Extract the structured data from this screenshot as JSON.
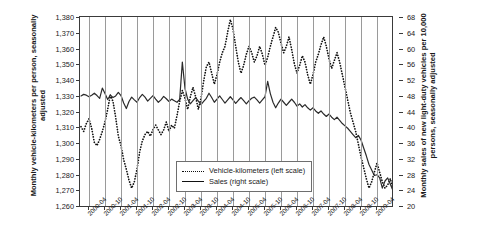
{
  "chart_data": {
    "type": "line",
    "title": "",
    "xlabel": "",
    "ylabel": "Monthly vehicle-kilometers per person, seasonally adjusted",
    "y2label": "Monthly sales of new light-duty vehicles per 10,000 persons, seasonally adjusted",
    "ylim": [
      1260,
      1380
    ],
    "y2lim": [
      20,
      68
    ],
    "ytick_labels": [
      "1,380",
      "1,370",
      "1,360",
      "1,350",
      "1,340",
      "1,330",
      "1,320",
      "1,310",
      "1,300",
      "1,290",
      "1,280",
      "1,270",
      "1,260"
    ],
    "ytick_values": [
      1380,
      1370,
      1360,
      1350,
      1340,
      1330,
      1320,
      1310,
      1300,
      1290,
      1280,
      1270,
      1260
    ],
    "y2tick_labels": [
      "68",
      "64",
      "60",
      "56",
      "52",
      "48",
      "44",
      "40",
      "36",
      "32",
      "28",
      "24",
      "20"
    ],
    "y2tick_values": [
      68,
      64,
      60,
      56,
      52,
      48,
      44,
      40,
      36,
      32,
      28,
      24,
      20
    ],
    "grid": "vertical",
    "legend_position": "inside-bottom-center",
    "x_start": "2000-01",
    "x_end": "2009-06",
    "xtick_labels": [
      "2000-04",
      "2000-10",
      "2001-04",
      "2001-10",
      "2002-04",
      "2002-10",
      "2003-04",
      "2003-10",
      "2004-04",
      "2004-10",
      "2005-04",
      "2005-10",
      "2006-04",
      "2006-10",
      "2007-04",
      "2007-10",
      "2008-04",
      "2008-10",
      "2009-04"
    ],
    "xtick_index": [
      3,
      9,
      15,
      21,
      27,
      33,
      39,
      45,
      51,
      57,
      63,
      69,
      75,
      81,
      87,
      93,
      99,
      105,
      111
    ],
    "series": [
      {
        "name": "Vehicle-kilometers (left scale)",
        "axis": "left",
        "style": "dotted",
        "color": "#111111",
        "values": [
          1311,
          1308,
          1313,
          1316,
          1310,
          1301,
          1299,
          1303,
          1308,
          1314,
          1322,
          1331,
          1327,
          1317,
          1305,
          1299,
          1290,
          1284,
          1277,
          1272,
          1276,
          1284,
          1295,
          1302,
          1306,
          1308,
          1305,
          1309,
          1312,
          1309,
          1306,
          1309,
          1314,
          1308,
          1312,
          1310,
          1318,
          1327,
          1334,
          1329,
          1322,
          1330,
          1336,
          1330,
          1322,
          1329,
          1340,
          1349,
          1352,
          1345,
          1338,
          1344,
          1352,
          1358,
          1362,
          1371,
          1379,
          1373,
          1362,
          1352,
          1345,
          1350,
          1357,
          1362,
          1358,
          1352,
          1356,
          1362,
          1357,
          1350,
          1355,
          1362,
          1368,
          1374,
          1371,
          1364,
          1358,
          1362,
          1368,
          1360,
          1351,
          1345,
          1350,
          1356,
          1352,
          1344,
          1338,
          1344,
          1352,
          1357,
          1363,
          1368,
          1362,
          1354,
          1348,
          1353,
          1358,
          1352,
          1344,
          1336,
          1328,
          1320,
          1314,
          1308,
          1300,
          1292,
          1285,
          1278,
          1272,
          1276,
          1282,
          1288,
          1282,
          1276,
          1272,
          1274,
          1278,
          1271
        ]
      },
      {
        "name": "Sales (right scale)",
        "axis": "right",
        "style": "solid",
        "color": "#2b2b2b",
        "values": [
          48.2,
          48.6,
          48.4,
          48.0,
          48.4,
          48.9,
          48.3,
          47.6,
          50.2,
          48.8,
          47.3,
          48.4,
          47.8,
          48.2,
          49.1,
          48.3,
          46.4,
          45.0,
          46.8,
          47.9,
          47.2,
          46.6,
          47.8,
          48.6,
          47.9,
          46.9,
          47.6,
          48.3,
          47.4,
          46.6,
          47.2,
          48.1,
          47.5,
          46.8,
          47.4,
          47.0,
          46.6,
          47.3,
          56.8,
          50.1,
          47.4,
          46.2,
          47.0,
          47.8,
          46.9,
          46.0,
          46.8,
          47.6,
          48.9,
          47.8,
          46.6,
          47.4,
          48.2,
          47.3,
          46.4,
          47.2,
          48.0,
          47.2,
          46.3,
          47.1,
          47.8,
          47.0,
          46.2,
          47.0,
          47.6,
          47.9,
          47.2,
          46.4,
          47.2,
          48.0,
          51.9,
          48.8,
          46.6,
          45.2,
          46.4,
          47.4,
          46.6,
          45.8,
          46.6,
          47.4,
          46.6,
          45.6,
          46.2,
          45.4,
          46.0,
          45.2,
          44.6,
          45.2,
          44.4,
          43.8,
          44.4,
          43.6,
          43.0,
          43.6,
          42.8,
          42.2,
          42.8,
          42.0,
          41.2,
          40.6,
          40.0,
          39.2,
          38.4,
          37.6,
          38.2,
          37.0,
          35.0,
          33.0,
          30.8,
          29.4,
          28.0,
          28.2,
          27.4,
          24.8,
          26.6,
          27.4,
          25.8,
          24.2
        ]
      }
    ]
  },
  "legend": {
    "items": [
      {
        "label": "Vehicle-kilometers (left scale)",
        "style": "dotted"
      },
      {
        "label": "Sales (right scale)",
        "style": "solid"
      }
    ]
  }
}
